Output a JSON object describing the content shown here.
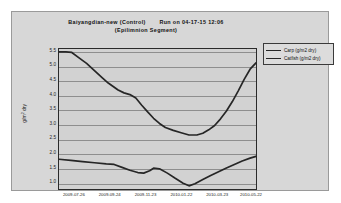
{
  "chart_data": {
    "type": "line",
    "title": "Baiyangdian-new (Control)",
    "run_label": "Run on 04-17-15 12:06",
    "subtitle": "(Epilimnion Segment)",
    "xlabel": "",
    "ylabel": "g/m dry",
    "ylabel_sup": "2",
    "ylim": [
      0.75,
      5.6
    ],
    "yticks": [
      5.5,
      5.0,
      4.5,
      4.0,
      3.5,
      3.0,
      2.5,
      2.0,
      1.5,
      1.0
    ],
    "ytick_labels": [
      "5.5",
      "5.0",
      "4.5",
      "4.0",
      "3.5",
      "3.0",
      "2.5",
      "2.0",
      "1.5",
      "1.0"
    ],
    "grid": true,
    "legend_position": "top-right",
    "categories": [
      "2009-07-26",
      "2009-09-24",
      "2009-11-23",
      "2010-01-22",
      "2010-03-23",
      "2010-05-22"
    ],
    "xtick_positions_pct": [
      8,
      26,
      44,
      62,
      80,
      97
    ],
    "xlim_labels": [
      "2009-07-26",
      "2010-06-20"
    ],
    "series": [
      {
        "name": "Carp (g/m2 dry)",
        "color": "#262626",
        "points": [
          {
            "x": 0.0,
            "y": 5.5
          },
          {
            "x": 3.5,
            "y": 5.5
          },
          {
            "x": 6.5,
            "y": 5.48
          },
          {
            "x": 10.0,
            "y": 5.3
          },
          {
            "x": 14.0,
            "y": 5.1
          },
          {
            "x": 18.0,
            "y": 4.85
          },
          {
            "x": 22.0,
            "y": 4.6
          },
          {
            "x": 25.0,
            "y": 4.42
          },
          {
            "x": 27.5,
            "y": 4.3
          },
          {
            "x": 30.0,
            "y": 4.18
          },
          {
            "x": 33.0,
            "y": 4.08
          },
          {
            "x": 36.0,
            "y": 4.02
          },
          {
            "x": 39.0,
            "y": 3.9
          },
          {
            "x": 42.0,
            "y": 3.65
          },
          {
            "x": 45.0,
            "y": 3.42
          },
          {
            "x": 48.0,
            "y": 3.2
          },
          {
            "x": 51.0,
            "y": 3.02
          },
          {
            "x": 54.0,
            "y": 2.88
          },
          {
            "x": 58.0,
            "y": 2.78
          },
          {
            "x": 62.0,
            "y": 2.7
          },
          {
            "x": 66.0,
            "y": 2.62
          },
          {
            "x": 70.0,
            "y": 2.62
          },
          {
            "x": 73.0,
            "y": 2.68
          },
          {
            "x": 76.0,
            "y": 2.8
          },
          {
            "x": 79.0,
            "y": 2.95
          },
          {
            "x": 82.0,
            "y": 3.18
          },
          {
            "x": 85.0,
            "y": 3.45
          },
          {
            "x": 88.0,
            "y": 3.78
          },
          {
            "x": 91.0,
            "y": 4.15
          },
          {
            "x": 94.0,
            "y": 4.55
          },
          {
            "x": 97.0,
            "y": 4.9
          },
          {
            "x": 100.0,
            "y": 5.12
          }
        ]
      },
      {
        "name": "Catfish (g/m2 dry)",
        "color": "#262626",
        "points": [
          {
            "x": 0.0,
            "y": 1.78
          },
          {
            "x": 6.0,
            "y": 1.74
          },
          {
            "x": 12.0,
            "y": 1.7
          },
          {
            "x": 18.0,
            "y": 1.66
          },
          {
            "x": 24.0,
            "y": 1.62
          },
          {
            "x": 28.0,
            "y": 1.6
          },
          {
            "x": 32.0,
            "y": 1.5
          },
          {
            "x": 36.0,
            "y": 1.4
          },
          {
            "x": 40.0,
            "y": 1.32
          },
          {
            "x": 43.0,
            "y": 1.3
          },
          {
            "x": 46.0,
            "y": 1.38
          },
          {
            "x": 48.0,
            "y": 1.47
          },
          {
            "x": 51.0,
            "y": 1.45
          },
          {
            "x": 55.0,
            "y": 1.3
          },
          {
            "x": 59.0,
            "y": 1.12
          },
          {
            "x": 63.0,
            "y": 0.95
          },
          {
            "x": 66.0,
            "y": 0.86
          },
          {
            "x": 69.0,
            "y": 0.93
          },
          {
            "x": 73.0,
            "y": 1.08
          },
          {
            "x": 77.0,
            "y": 1.22
          },
          {
            "x": 81.0,
            "y": 1.35
          },
          {
            "x": 85.0,
            "y": 1.48
          },
          {
            "x": 89.0,
            "y": 1.6
          },
          {
            "x": 93.0,
            "y": 1.72
          },
          {
            "x": 97.0,
            "y": 1.82
          },
          {
            "x": 100.0,
            "y": 1.88
          }
        ]
      }
    ]
  },
  "legend": {
    "entries": [
      {
        "label": "Carp (g/m2 dry)"
      },
      {
        "label": "Catfish (g/m2 dry)"
      }
    ]
  }
}
